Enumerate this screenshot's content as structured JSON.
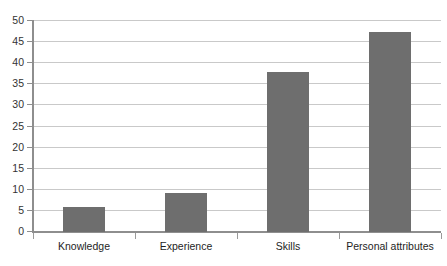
{
  "chart_data": {
    "type": "bar",
    "title": "",
    "subtitle": "",
    "xlabel": "",
    "ylabel": "",
    "categories": [
      "Knowledge",
      "Experience",
      "Skills",
      "Personal attributes"
    ],
    "values": [
      6,
      9.2,
      38,
      47.5
    ],
    "series": [
      {
        "name": "",
        "values": [
          6,
          9.2,
          38,
          47.5
        ]
      }
    ],
    "ylim": [
      0,
      50
    ],
    "yticks": [
      0,
      5,
      10,
      15,
      20,
      25,
      30,
      35,
      40,
      45,
      50
    ],
    "ytick_labels": [
      "0",
      "5",
      "10",
      "15",
      "20",
      "25",
      "30",
      "35",
      "40",
      "45",
      "50"
    ],
    "grid": true,
    "grid_axis": "y",
    "legend": false,
    "legend_position": "none",
    "bar_color": "#6e6e6e",
    "gridline_color": "#c9c9c9",
    "axis_color": "#8e8e8e",
    "background_color": "#ffffff",
    "annotations": []
  }
}
